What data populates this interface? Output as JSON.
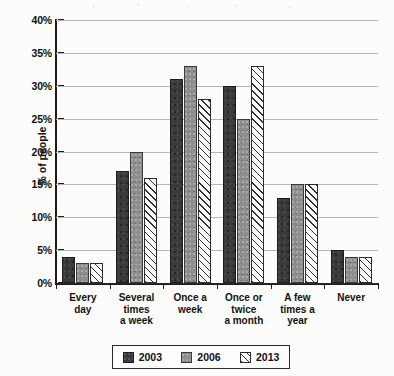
{
  "chart_data": {
    "type": "bar",
    "title": "",
    "xlabel": "",
    "ylabel": "% of people",
    "ylim": [
      0,
      40
    ],
    "y_tick_step": 5,
    "y_tick_labels": [
      "0%",
      "5%",
      "10%",
      "15%",
      "20%",
      "25%",
      "30%",
      "35%",
      "40%"
    ],
    "grid": "horizontal",
    "legend_position": "bottom",
    "categories": [
      "Every\nday",
      "Several\ntimes\na week",
      "Once a\nweek",
      "Once or\ntwice\na month",
      "A few\ntimes a\nyear",
      "Never"
    ],
    "series": [
      {
        "name": "2003",
        "color": "#3b3b3b",
        "fill": "solid-dark",
        "values": [
          4,
          17,
          31,
          30,
          13,
          5
        ]
      },
      {
        "name": "2006",
        "color": "#8e8e8e",
        "fill": "solid-gray",
        "values": [
          3,
          20,
          33,
          25,
          15,
          4
        ]
      },
      {
        "name": "2013",
        "color": "#fbfbfb",
        "fill": "diagonal-hatch",
        "values": [
          3,
          16,
          28,
          33,
          15,
          4
        ]
      }
    ]
  },
  "legend": {
    "entries": [
      {
        "label": "2003"
      },
      {
        "label": "2006"
      },
      {
        "label": "2013"
      }
    ]
  },
  "axis": {
    "y_title": "% of people"
  }
}
